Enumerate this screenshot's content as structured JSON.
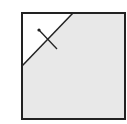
{
  "diagram": {
    "colors": {
      "background": "#ffffff",
      "stroke": "#222222",
      "shaded_fill": "#e8e8e8",
      "unshaded_fill": "#ffffff"
    },
    "square": {
      "x": 22,
      "y": 13,
      "width": 103,
      "height": 106
    },
    "cut_line": {
      "x1": 22,
      "y1": 66,
      "x2": 73,
      "y2": 13
    },
    "crossing_segment": {
      "x1": 39,
      "y1": 30,
      "x2": 57,
      "y2": 49,
      "dot_radius": 1.6
    }
  }
}
